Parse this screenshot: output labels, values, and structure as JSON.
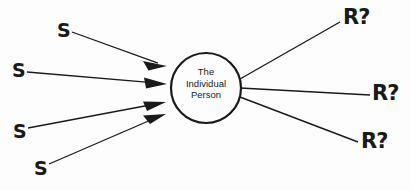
{
  "diagram": {
    "background_color": "#fdfdfd",
    "stroke_color": "#1a1a1a",
    "central_node": {
      "shape": "circle",
      "label_lines": [
        "The",
        "Individual",
        "Person"
      ],
      "line1": "The",
      "line2": "Individual",
      "line3": "Person",
      "center_x": 206,
      "center_y": 88,
      "radius": 35
    },
    "inputs": {
      "label_text": "S",
      "count": 4,
      "arrowheads": true,
      "items": [
        {
          "label": "S",
          "x": 57,
          "y": 21,
          "line_from_x": 72,
          "line_from_y": 32,
          "line_to_x": 167,
          "line_to_y": 66
        },
        {
          "label": "S",
          "x": 12,
          "y": 61,
          "line_from_x": 27,
          "line_from_y": 72,
          "line_to_x": 167,
          "line_to_y": 84
        },
        {
          "label": "S",
          "x": 13,
          "y": 122,
          "line_from_x": 28,
          "line_from_y": 128,
          "line_to_x": 166,
          "line_to_y": 102
        },
        {
          "label": "S",
          "x": 34,
          "y": 159,
          "line_from_x": 49,
          "line_from_y": 164,
          "line_to_x": 166,
          "line_to_y": 114
        }
      ]
    },
    "outputs": {
      "label_text": "R?",
      "count": 3,
      "arrowheads": false,
      "items": [
        {
          "label": "R?",
          "x": 343,
          "y": 7,
          "line_from_x": 240,
          "line_from_y": 79,
          "line_to_x": 340,
          "line_to_y": 22
        },
        {
          "label": "R?",
          "x": 372,
          "y": 83,
          "line_from_x": 240,
          "line_from_y": 88,
          "line_to_x": 370,
          "line_to_y": 95
        },
        {
          "label": "R?",
          "x": 361,
          "y": 131,
          "line_from_x": 240,
          "line_from_y": 97,
          "line_to_x": 358,
          "line_to_y": 142
        }
      ]
    }
  }
}
